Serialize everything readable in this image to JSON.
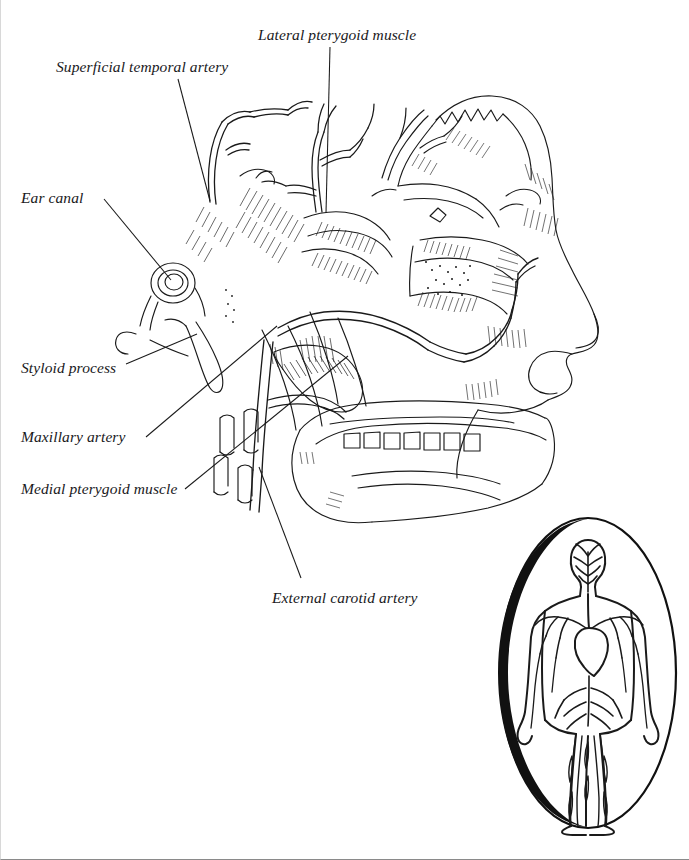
{
  "figure": {
    "type": "anatomical-illustration",
    "style": "black-and-white pen-and-ink line drawing with hatching",
    "background_color": "#ffffff",
    "line_color": "#1a1a1a"
  },
  "labels": [
    {
      "id": "superficial-temporal-artery",
      "text": "Superficial temporal artery",
      "leader": {
        "from_x": 178,
        "from_y": 78,
        "to_x": 209,
        "to_y": 200
      }
    },
    {
      "id": "lateral-pterygoid-muscle",
      "text": "Lateral pterygoid muscle",
      "leader": {
        "from_x": 330,
        "from_y": 46,
        "to_x": 327,
        "to_y": 212
      }
    },
    {
      "id": "ear-canal",
      "text": "Ear canal",
      "leader": {
        "from_x": 104,
        "top_y": 200,
        "from_y": 200,
        "to_x": 170,
        "to_y": 279
      }
    },
    {
      "id": "styloid-process",
      "text": "Styloid process",
      "leader": {
        "from_x": 125,
        "from_y": 364,
        "to_x": 196,
        "to_y": 333
      }
    },
    {
      "id": "maxillary-artery",
      "text": "Maxillary artery",
      "leader": {
        "from_x": 145,
        "from_y": 437,
        "to_x": 276,
        "to_y": 325
      }
    },
    {
      "id": "medial-pterygoid-muscle",
      "text": "Medial pterygoid muscle",
      "leader": {
        "from_x": 184,
        "from_y": 489,
        "to_x": 347,
        "to_y": 355
      }
    },
    {
      "id": "external-carotid-artery",
      "text": "External carotid artery",
      "leader": {
        "from_x": 300,
        "from_y": 578,
        "to_x": 259,
        "to_y": 466
      }
    }
  ],
  "inset": {
    "id": "circulatory-system-inset",
    "description": "Oval vignette of a full human body showing the circulatory system",
    "frame_shape": "oval",
    "frame_color": "#111111",
    "center_x": 588,
    "center_y": 673,
    "radius_x": 88,
    "radius_y": 155
  }
}
